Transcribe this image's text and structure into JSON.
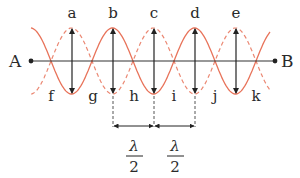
{
  "diagram": {
    "type": "standing-wave",
    "end_labels": {
      "left": "A",
      "right": "B"
    },
    "antinode_labels": [
      "a",
      "b",
      "c",
      "d",
      "e"
    ],
    "node_labels": [
      "f",
      "g",
      "h",
      "i",
      "j",
      "k"
    ],
    "spacing_labels": [
      {
        "numerator": "λ",
        "denominator": "2"
      },
      {
        "numerator": "λ",
        "denominator": "2"
      }
    ],
    "colors": {
      "wave": "#e8735a",
      "axis": "#333333",
      "arrows": "#222222",
      "text": "#2a2a2a"
    }
  }
}
